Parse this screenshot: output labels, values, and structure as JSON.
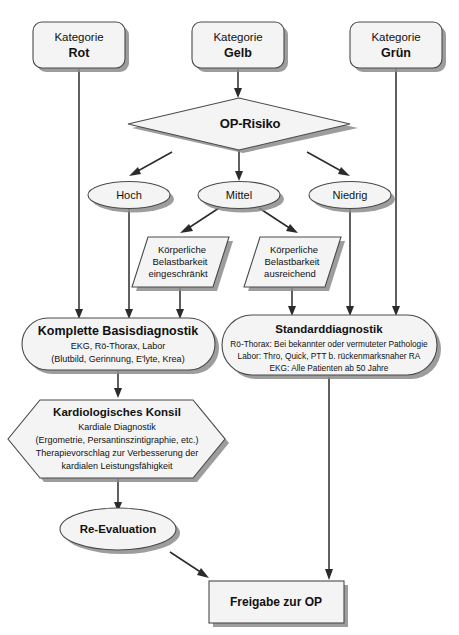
{
  "diagram": {
    "colors": {
      "shape_fill": "#f4f4f4",
      "shape_stroke": "#4a4a4a",
      "shadow": "#8c8c8c",
      "connector": "#2b2b2b",
      "text": "#111111",
      "background": "#ffffff"
    },
    "categories": [
      {
        "id": "rot",
        "line1": "Kategorie",
        "line2": "Rot"
      },
      {
        "id": "gelb",
        "line1": "Kategorie",
        "line2": "Gelb"
      },
      {
        "id": "gruen",
        "line1": "Kategorie",
        "line2": "Grün"
      }
    ],
    "decision": {
      "label": "OP-Risiko"
    },
    "risk_levels": [
      {
        "id": "hoch",
        "label": "Hoch"
      },
      {
        "id": "mittel",
        "label": "Mittel"
      },
      {
        "id": "niedrig",
        "label": "Niedrig"
      }
    ],
    "capacity": [
      {
        "id": "eingeschraenkt",
        "line1": "Körperliche",
        "line2": "Belastbarkeit",
        "line3": "eingeschränkt"
      },
      {
        "id": "ausreichend",
        "line1": "Körperliche",
        "line2": "Belastbarkeit",
        "line3": "ausreichend"
      }
    ],
    "basis_diagnostik": {
      "title": "Komplette Basisdiagnostik",
      "line1": "EKG, Rö-Thorax, Labor",
      "line2": "(Blutbild, Gerinnung, E'lyte, Krea)"
    },
    "standard_diagnostik": {
      "title": "Standarddiagnostik",
      "line1": "Rö-Thorax: Bei bekannter oder vermuteter Pathologie",
      "line2": "Labor: Thro, Quick, PTT b. rückenmarksnaher RA",
      "line3": "EKG: Alle Patienten ab 50 Jahre"
    },
    "konsil": {
      "title": "Kardiologisches Konsil",
      "line1": "Kardiale Diagnostik",
      "line2": "(Ergometrie, Persantinszintigraphie, etc.)",
      "line3": "Therapievorschlag zur Verbesserung der",
      "line4": "kardialen Leistungsfähigkeit"
    },
    "reevaluation": {
      "label": "Re-Evaluation"
    },
    "final": {
      "label": "Freigabe zur OP"
    }
  }
}
